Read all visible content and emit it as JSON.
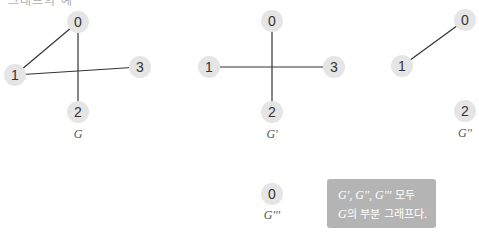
{
  "heading_clipped": "그래프의 예",
  "colors": {
    "node_fill": "#e5e5e5",
    "edge": "#333333",
    "note_box": "#b4b4b4",
    "note_text": "#ffffff"
  },
  "graphs": [
    {
      "label": "G",
      "nodes": [
        {
          "id": "0",
          "x": 78,
          "y": 22
        },
        {
          "id": "1",
          "x": 15,
          "y": 75
        },
        {
          "id": "2",
          "x": 78,
          "y": 112
        },
        {
          "id": "3",
          "x": 140,
          "y": 67
        }
      ],
      "edges": [
        [
          "0",
          "1"
        ],
        [
          "0",
          "2"
        ],
        [
          "1",
          "3"
        ]
      ]
    },
    {
      "label": "G'",
      "nodes": [
        {
          "id": "0",
          "x": 272,
          "y": 21
        },
        {
          "id": "1",
          "x": 209,
          "y": 67
        },
        {
          "id": "2",
          "x": 272,
          "y": 112
        },
        {
          "id": "3",
          "x": 334,
          "y": 67
        }
      ],
      "edges": [
        [
          "0",
          "2"
        ],
        [
          "1",
          "3"
        ]
      ]
    },
    {
      "label": "G''",
      "nodes": [
        {
          "id": "0",
          "x": 465,
          "y": 20
        },
        {
          "id": "1",
          "x": 402,
          "y": 66
        },
        {
          "id": "2",
          "x": 465,
          "y": 111
        }
      ],
      "edges": [
        [
          "0",
          "1"
        ]
      ]
    },
    {
      "label": "G'''",
      "nodes": [
        {
          "id": "0",
          "x": 272,
          "y": 194
        }
      ],
      "edges": []
    }
  ],
  "note": {
    "line1_symbols": "G', G'', G'''",
    "line1_text": " 모두",
    "line2_symbol": "G",
    "line2_text": "의 부분 그래프다."
  }
}
